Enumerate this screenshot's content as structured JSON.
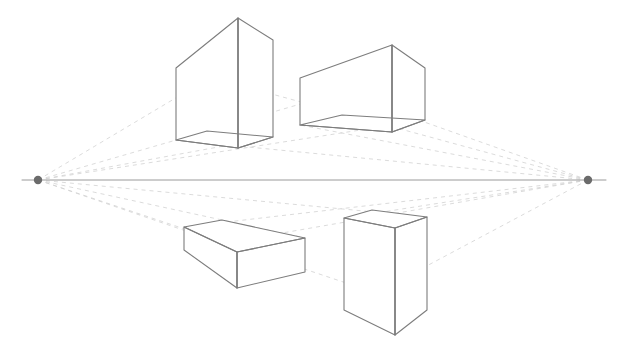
{
  "diagram": {
    "type": "perspective-construction-drawing",
    "canvas": {
      "width": 625,
      "height": 353,
      "background": "#ffffff"
    },
    "colors": {
      "edge": "#7d7d7d",
      "guide": "#d2d2d2",
      "horizon": "#9a9a9a",
      "vanishing_point": "#6b6b6b",
      "face_fill": "#ffffff"
    },
    "stroke_widths": {
      "edge": 1.1,
      "guide": 0.8,
      "horizon": 1.0
    },
    "guide_dash": "4 4"
  },
  "horizon": {
    "label": "horizon-line",
    "y": 180,
    "x_start": 22,
    "x_end": 606
  },
  "vanishing_points": [
    {
      "id": "vp-left",
      "label": "Left Vanishing Point",
      "x": 38,
      "y": 180,
      "radius": 4.2
    },
    {
      "id": "vp-right",
      "label": "Right Vanishing Point",
      "x": 588,
      "y": 180,
      "radius": 4.2
    }
  ],
  "boxes": [
    {
      "id": "box-top-left",
      "label": "Upper Left Box",
      "position": "above-horizon",
      "view": "from-below",
      "front_vertical": {
        "x": 238,
        "y_top": 18,
        "y_bottom": 148
      },
      "left_vertical": {
        "x": 176,
        "y_top": 68,
        "y_bottom": 140
      },
      "right_vertical": {
        "x": 273,
        "y_top": 40,
        "y_bottom": 137
      },
      "hidden_back_vertical": {
        "x": 207,
        "y_top": 79,
        "y_bottom": 131
      },
      "faces": {
        "left": "176,68 238,18 238,148 176,140",
        "right": "238,18 273,40 273,137 238,148"
      },
      "bottom_face": "176,140 238,148 273,137 207,131"
    },
    {
      "id": "box-top-right",
      "label": "Upper Right Box",
      "position": "above-horizon",
      "view": "from-below",
      "front_vertical": {
        "x": 392,
        "y_top": 45,
        "y_bottom": 132
      },
      "left_vertical": {
        "x": 300,
        "y_top": 78,
        "y_bottom": 125
      },
      "right_vertical": {
        "x": 425,
        "y_top": 68,
        "y_bottom": 120
      },
      "hidden_back_vertical": {
        "x": 342,
        "y_top": 96,
        "y_bottom": 115
      },
      "faces": {
        "left": "300,78 392,45 392,132 300,125",
        "right": "392,45 425,68 425,120 392,132"
      },
      "bottom_face": "300,125 392,132 425,120 342,115"
    },
    {
      "id": "box-bottom-left",
      "label": "Lower Left Box",
      "position": "below-horizon",
      "view": "from-above",
      "front_vertical": {
        "x": 237,
        "y_top": 252,
        "y_bottom": 288
      },
      "left_vertical": {
        "x": 184,
        "y_top": 227,
        "y_bottom": 250
      },
      "right_vertical": {
        "x": 305,
        "y_top": 238,
        "y_bottom": 272
      },
      "hidden_back_vertical": {
        "x": 222,
        "y_top": 220,
        "y_bottom": 241
      },
      "faces": {
        "left": "184,227 237,252 237,288 184,250",
        "right": "237,252 305,238 305,272 237,288"
      },
      "top_face": "184,227 222,220 305,238 237,252"
    },
    {
      "id": "box-bottom-right",
      "label": "Lower Right Box",
      "position": "below-horizon",
      "view": "from-above",
      "front_vertical": {
        "x": 395,
        "y_top": 228,
        "y_bottom": 335
      },
      "left_vertical": {
        "x": 344,
        "y_top": 218,
        "y_bottom": 310
      },
      "right_vertical": {
        "x": 427,
        "y_top": 217,
        "y_bottom": 310
      },
      "hidden_back_vertical": {
        "x": 372,
        "y_top": 210,
        "y_bottom": 300
      },
      "faces": {
        "left": "344,218 395,228 395,335 344,310",
        "right": "395,228 427,217 427,310 395,335"
      },
      "top_face": "344,218 372,210 427,217 395,228"
    }
  ],
  "guide_lines": [
    {
      "from": "vp-left",
      "x1": 38,
      "y1": 180,
      "x2": 273,
      "y2": 40
    },
    {
      "from": "vp-left",
      "x1": 38,
      "y1": 180,
      "x2": 273,
      "y2": 137
    },
    {
      "from": "vp-left",
      "x1": 38,
      "y1": 180,
      "x2": 425,
      "y2": 68
    },
    {
      "from": "vp-left",
      "x1": 38,
      "y1": 180,
      "x2": 425,
      "y2": 120
    },
    {
      "from": "vp-left",
      "x1": 38,
      "y1": 180,
      "x2": 305,
      "y2": 238
    },
    {
      "from": "vp-left",
      "x1": 38,
      "y1": 180,
      "x2": 305,
      "y2": 272
    },
    {
      "from": "vp-left",
      "x1": 38,
      "y1": 180,
      "x2": 427,
      "y2": 217
    },
    {
      "from": "vp-left",
      "x1": 38,
      "y1": 180,
      "x2": 427,
      "y2": 310
    },
    {
      "from": "vp-right",
      "x1": 588,
      "y1": 180,
      "x2": 176,
      "y2": 68
    },
    {
      "from": "vp-right",
      "x1": 588,
      "y1": 180,
      "x2": 176,
      "y2": 140
    },
    {
      "from": "vp-right",
      "x1": 588,
      "y1": 180,
      "x2": 300,
      "y2": 78
    },
    {
      "from": "vp-right",
      "x1": 588,
      "y1": 180,
      "x2": 300,
      "y2": 125
    },
    {
      "from": "vp-right",
      "x1": 588,
      "y1": 180,
      "x2": 184,
      "y2": 227
    },
    {
      "from": "vp-right",
      "x1": 588,
      "y1": 180,
      "x2": 184,
      "y2": 250
    },
    {
      "from": "vp-right",
      "x1": 588,
      "y1": 180,
      "x2": 344,
      "y2": 218
    },
    {
      "from": "vp-right",
      "x1": 588,
      "y1": 180,
      "x2": 344,
      "y2": 310
    }
  ]
}
